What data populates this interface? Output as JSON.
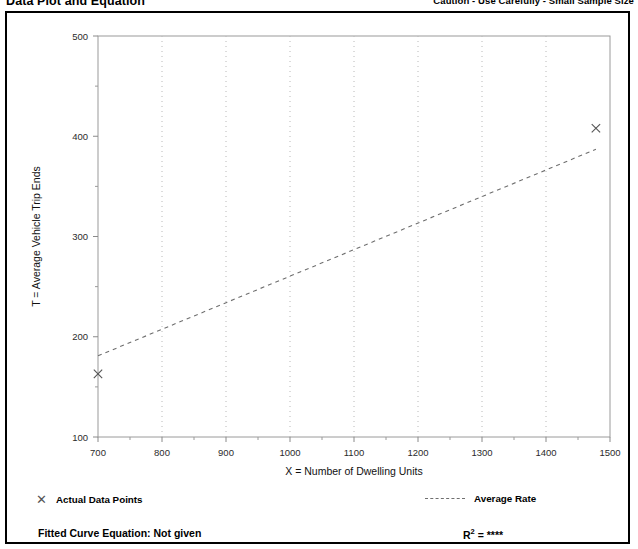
{
  "header": {
    "title": "Data Plot and Equation",
    "caution": "Caution - Use Carefully - Small Sample Size"
  },
  "legend": {
    "actual_points_label": "Actual Data Points",
    "average_rate_label": "Average Rate",
    "marker_icon": "x-marker-icon",
    "line_icon": "dashed-line-icon"
  },
  "footer": {
    "fitted_curve_label": "Fitted Curve Equation:  Not given",
    "r2_prefix": "R",
    "r2_exponent": "2",
    "r2_value": " = ****"
  },
  "chart_data": {
    "type": "scatter",
    "title": "Data Plot and Equation",
    "xlabel": "X = Number of Dwelling Units",
    "ylabel": "T = Average Vehicle Trip Ends",
    "xlim": [
      700,
      1500
    ],
    "ylim": [
      100,
      500
    ],
    "xticks": [
      700,
      800,
      900,
      1000,
      1100,
      1200,
      1300,
      1400,
      1500
    ],
    "yticks": [
      100,
      200,
      300,
      400,
      500
    ],
    "xtick_labels": [
      "700",
      "800",
      "900",
      "1000",
      "1100",
      "1200",
      "1300",
      "1400",
      "1500"
    ],
    "ytick_labels": [
      "100",
      "200",
      "300",
      "400",
      "500"
    ],
    "xminor_step": 50,
    "grid": "vertical-dotted",
    "legend_position": "below-plot",
    "series": [
      {
        "name": "Actual Data Points",
        "type": "scatter",
        "marker": "x",
        "color": "#555555",
        "points": [
          {
            "x": 700,
            "y": 163
          },
          {
            "x": 1478,
            "y": 408
          }
        ]
      },
      {
        "name": "Average Rate",
        "type": "line",
        "style": "dashed",
        "color": "#6f6f6f",
        "points": [
          {
            "x": 700,
            "y": 181
          },
          {
            "x": 1478,
            "y": 387
          }
        ]
      }
    ]
  }
}
